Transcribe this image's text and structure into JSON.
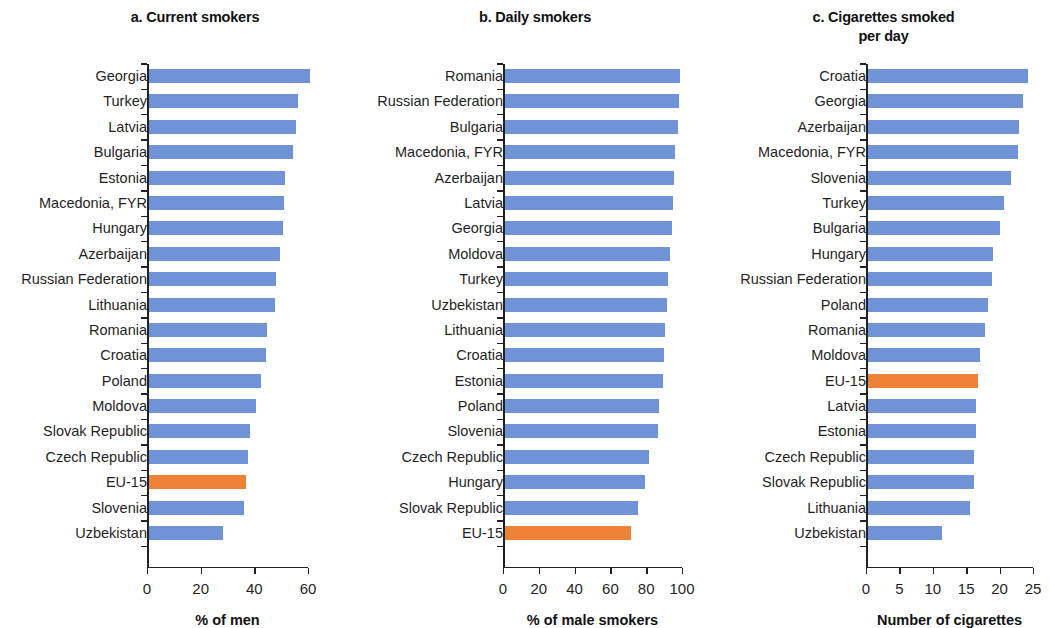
{
  "figure": {
    "background_color": "#ffffff",
    "bar_color": "#6f93d6",
    "highlight_color": "#ee8338",
    "highlight_category": "EU-15"
  },
  "chart_data": [
    {
      "type": "bar",
      "orientation": "horizontal",
      "panel": "a",
      "title": "a. Current smokers",
      "xlabel": "% of men",
      "ylabel": "",
      "xlim": [
        0,
        60
      ],
      "xticks": [
        0,
        20,
        40,
        60
      ],
      "xtick_labels": [
        "0",
        "20",
        "40",
        "60"
      ],
      "grid": false,
      "legend": "none",
      "categories": [
        "Georgia",
        "Turkey",
        "Latvia",
        "Bulgaria",
        "Estonia",
        "Macedonia, FYR",
        "Hungary",
        "Azerbaijan",
        "Russian Federation",
        "Lithuania",
        "Romania",
        "Croatia",
        "Poland",
        "Moldova",
        "Slovak Republic",
        "Czech Republic",
        "EU-15",
        "Slovenia",
        "Uzbekistan"
      ],
      "values": [
        60.8,
        56.1,
        55.6,
        54.5,
        51.5,
        51.2,
        50.5,
        49.4,
        48.0,
        47.6,
        44.7,
        44.3,
        42.4,
        40.5,
        38.5,
        37.6,
        36.8,
        36.1,
        28.3
      ]
    },
    {
      "type": "bar",
      "orientation": "horizontal",
      "panel": "b",
      "title": "b. Daily smokers",
      "xlabel": "% of male smokers",
      "ylabel": "",
      "xlim": [
        0,
        100
      ],
      "xticks": [
        0,
        20,
        40,
        60,
        80,
        100
      ],
      "xtick_labels": [
        "0",
        "20",
        "40",
        "60",
        "80",
        "100"
      ],
      "grid": false,
      "legend": "none",
      "categories": [
        "Romania",
        "Russian Federation",
        "Bulgaria",
        "Macedonia, FYR",
        "Azerbaijan",
        "Latvia",
        "Georgia",
        "Moldova",
        "Turkey",
        "Uzbekistan",
        "Lithuania",
        "Croatia",
        "Estonia",
        "Poland",
        "Slovenia",
        "Czech Republic",
        "Hungary",
        "Slovak Republic",
        "EU-15"
      ],
      "values": [
        98.9,
        98.3,
        97.8,
        96.1,
        95.5,
        95.0,
        94.4,
        93.3,
        92.2,
        91.6,
        90.5,
        90.0,
        89.4,
        87.2,
        86.6,
        81.6,
        79.3,
        75.4,
        71.5
      ]
    },
    {
      "type": "bar",
      "orientation": "horizontal",
      "panel": "c",
      "title": "c. Cigarettes smoked per day",
      "title_lines": [
        "c. Cigarettes smoked",
        "per day"
      ],
      "xlabel": "Number of cigarettes",
      "ylabel": "",
      "xlim": [
        0,
        25
      ],
      "xticks": [
        0,
        5,
        10,
        15,
        20,
        25
      ],
      "xtick_labels": [
        "0",
        "5",
        "10",
        "15",
        "20",
        "25"
      ],
      "grid": false,
      "legend": "none",
      "categories": [
        "Croatia",
        "Georgia",
        "Azerbaijan",
        "Macedonia, FYR",
        "Slovenia",
        "Turkey",
        "Bulgaria",
        "Hungary",
        "Russian Federation",
        "Poland",
        "Romania",
        "Moldova",
        "EU-15",
        "Latvia",
        "Estonia",
        "Czech Republic",
        "Slovak Republic",
        "Lithuania",
        "Uzbekistan"
      ],
      "values": [
        24.3,
        23.5,
        22.9,
        22.8,
        21.7,
        20.7,
        20.1,
        19.0,
        18.9,
        18.3,
        17.8,
        17.1,
        16.8,
        16.5,
        16.5,
        16.2,
        16.2,
        15.6,
        11.4
      ]
    }
  ]
}
